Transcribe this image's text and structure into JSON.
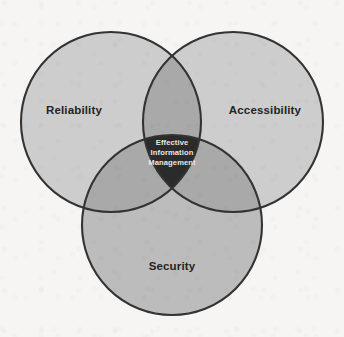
{
  "figure": {
    "kind": "venn-diagram-3-set",
    "background_color": "#f6f5f3",
    "stroke_color": "#333333"
  },
  "sets": [
    {
      "id": "reliability",
      "label": "Reliability",
      "position": "top-left",
      "fill_color": "#cdcdcd",
      "center_x": 111,
      "center_y": 122,
      "radius": 90,
      "label_x": 74,
      "label_y": 114
    },
    {
      "id": "accessibility",
      "label": "Accessibility",
      "position": "top-right",
      "fill_color": "#cdcdcd",
      "center_x": 233,
      "center_y": 122,
      "radius": 90,
      "label_x": 265,
      "label_y": 114
    },
    {
      "id": "security",
      "label": "Security",
      "position": "bottom",
      "fill_color": "#bcbcbc",
      "center_x": 172,
      "center_y": 225,
      "radius": 90,
      "label_x": 172,
      "label_y": 270
    }
  ],
  "overlaps": {
    "pairwise_fill_color": "#a9a9a9",
    "triple_fill_color": "#2b2b2b",
    "triple_text_color": "#e8e8e6"
  },
  "center": {
    "id": "effective-information-management",
    "label_lines": [
      "Effective",
      "Information",
      "Management"
    ],
    "full_label": "Effective Information Management",
    "x": 172,
    "y": 152
  }
}
